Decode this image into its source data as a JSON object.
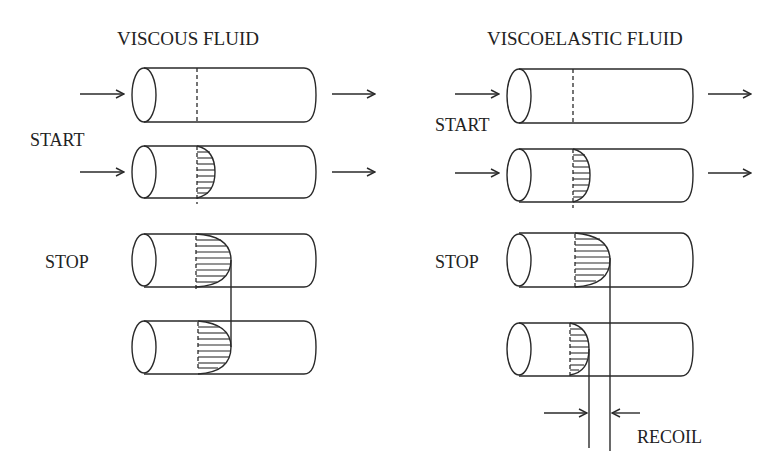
{
  "panels": [
    {
      "title": "VISCOUS FLUID",
      "start_label": "START",
      "stop_label": "STOP"
    },
    {
      "title": "VISCOELASTIC FLUID",
      "start_label": "START",
      "stop_label": "STOP",
      "recoil_label": "RECOIL"
    }
  ],
  "colors": {
    "line": "#2a2a2a",
    "text": "#222222",
    "background": "#ffffff"
  }
}
